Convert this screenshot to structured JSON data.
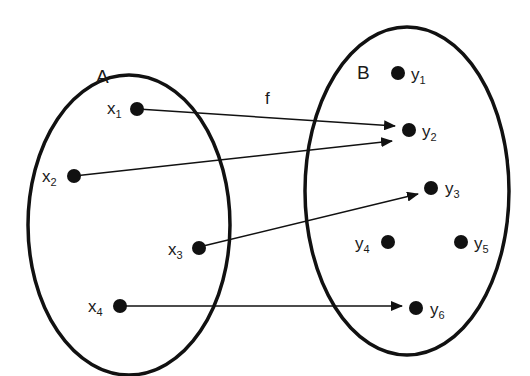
{
  "diagram": {
    "type": "function-mapping",
    "function_label": "f",
    "sets": [
      {
        "name": "A",
        "elements": [
          "x1",
          "x2",
          "x3",
          "x4"
        ]
      },
      {
        "name": "B",
        "elements": [
          "y1",
          "y2",
          "y3",
          "y4",
          "y5",
          "y6"
        ]
      }
    ],
    "mappings": [
      {
        "from": "x1",
        "to": "y2"
      },
      {
        "from": "x2",
        "to": "y2"
      },
      {
        "from": "x3",
        "to": "y3"
      },
      {
        "from": "x4",
        "to": "y6"
      }
    ],
    "labels": {
      "A": "A",
      "B": "B",
      "f": "f",
      "x1": {
        "base": "x",
        "sub": "1"
      },
      "x2": {
        "base": "x",
        "sub": "2"
      },
      "x3": {
        "base": "x",
        "sub": "3"
      },
      "x4": {
        "base": "x",
        "sub": "4"
      },
      "y1": {
        "base": "y",
        "sub": "1"
      },
      "y2": {
        "base": "y",
        "sub": "2"
      },
      "y3": {
        "base": "y",
        "sub": "3"
      },
      "y4": {
        "base": "y",
        "sub": "4"
      },
      "y5": {
        "base": "y",
        "sub": "5"
      },
      "y6": {
        "base": "y",
        "sub": "6"
      }
    },
    "colors": {
      "stroke": "#111111",
      "background": "#ffffff"
    }
  }
}
